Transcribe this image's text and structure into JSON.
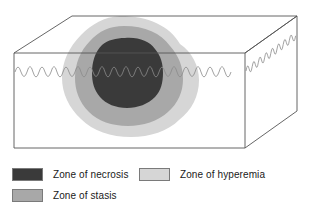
{
  "figure": {
    "colors": {
      "box_outline": "#555555",
      "skin_surface_line": "#8a8a8a",
      "background": "#ffffff",
      "necrosis": "#3a3a3a",
      "stasis": "#a8a8a8",
      "hyperemia": "#d6d6d6",
      "legend_border": "#7a7a7a",
      "text": "#1a1a1a"
    },
    "box": {
      "front_face": "14,53 245,53 245,148 14,148",
      "top_face": "14,53 72,16 297,16 245,53",
      "right_face": "245,53 297,16 297,111 245,148"
    },
    "zones": [
      {
        "id": "hyperemia",
        "name": "Zone of hyperemia",
        "color": "#d6d6d6",
        "order": 1
      },
      {
        "id": "stasis",
        "name": "Zone of stasis",
        "color": "#a8a8a8",
        "order": 2
      },
      {
        "id": "necrosis",
        "name": "Zone of necrosis",
        "color": "#3a3a3a",
        "order": 3
      }
    ],
    "skin_surface": {
      "label": "wavy skin surface line",
      "front_y": 68,
      "wave_amplitude": 7
    }
  },
  "legend": {
    "items": [
      {
        "id": "necrosis",
        "label": "Zone of necrosis",
        "color": "#3a3a3a"
      },
      {
        "id": "hyperemia",
        "label": "Zone of hyperemia",
        "color": "#d6d6d6"
      },
      {
        "id": "stasis",
        "label": "Zone of stasis",
        "color": "#a8a8a8"
      }
    ]
  }
}
